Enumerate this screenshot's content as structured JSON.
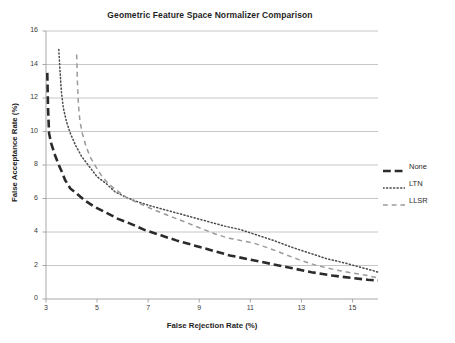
{
  "chart_data": {
    "type": "line",
    "title": "Geometric Feature Space Normalizer Comparison",
    "xlabel": "False Rejection Rate (%)",
    "ylabel": "False Acceptance Rate (%)",
    "xlim": [
      3,
      16
    ],
    "ylim": [
      0,
      16
    ],
    "xticks": [
      3,
      5,
      7,
      9,
      11,
      13,
      15
    ],
    "yticks": [
      0,
      2,
      4,
      6,
      8,
      10,
      12,
      14,
      16
    ],
    "grid": "horizontal",
    "legend_position": "right",
    "series": [
      {
        "name": "None",
        "style": "long-dash",
        "color": "#2b2b2b",
        "width": 2.6,
        "points": [
          [
            3.05,
            13.5
          ],
          [
            3.08,
            11.4
          ],
          [
            3.12,
            9.9
          ],
          [
            3.2,
            9.3
          ],
          [
            3.35,
            8.6
          ],
          [
            3.5,
            8.0
          ],
          [
            3.62,
            7.6
          ],
          [
            3.75,
            7.1
          ],
          [
            3.95,
            6.6
          ],
          [
            4.2,
            6.3
          ],
          [
            4.5,
            5.9
          ],
          [
            4.9,
            5.5
          ],
          [
            5.3,
            5.2
          ],
          [
            5.8,
            4.8
          ],
          [
            6.3,
            4.5
          ],
          [
            6.9,
            4.1
          ],
          [
            7.5,
            3.8
          ],
          [
            8.1,
            3.5
          ],
          [
            8.8,
            3.2
          ],
          [
            9.5,
            2.9
          ],
          [
            10.2,
            2.6
          ],
          [
            11.0,
            2.35
          ],
          [
            11.8,
            2.1
          ],
          [
            12.6,
            1.85
          ],
          [
            13.4,
            1.6
          ],
          [
            14.2,
            1.4
          ],
          [
            15.0,
            1.25
          ],
          [
            15.6,
            1.15
          ],
          [
            16.0,
            1.1
          ]
        ]
      },
      {
        "name": "LTN",
        "style": "dotted",
        "color": "#4a4a4a",
        "width": 1.5,
        "points": [
          [
            3.5,
            14.9
          ],
          [
            3.55,
            13.6
          ],
          [
            3.6,
            12.4
          ],
          [
            3.68,
            11.4
          ],
          [
            3.8,
            10.6
          ],
          [
            3.95,
            9.9
          ],
          [
            4.15,
            9.2
          ],
          [
            4.4,
            8.5
          ],
          [
            4.7,
            7.9
          ],
          [
            5.0,
            7.3
          ],
          [
            5.35,
            6.9
          ],
          [
            5.7,
            6.4
          ],
          [
            6.1,
            6.1
          ],
          [
            6.5,
            5.85
          ],
          [
            7.0,
            5.6
          ],
          [
            7.6,
            5.35
          ],
          [
            8.2,
            5.1
          ],
          [
            8.8,
            4.85
          ],
          [
            9.4,
            4.6
          ],
          [
            10.0,
            4.35
          ],
          [
            10.6,
            4.15
          ],
          [
            11.2,
            3.85
          ],
          [
            11.9,
            3.5
          ],
          [
            12.6,
            3.1
          ],
          [
            13.3,
            2.75
          ],
          [
            14.0,
            2.4
          ],
          [
            14.7,
            2.15
          ],
          [
            15.3,
            1.9
          ],
          [
            15.8,
            1.7
          ],
          [
            16.0,
            1.6
          ]
        ]
      },
      {
        "name": "LLSR",
        "style": "dash",
        "color": "#9a9a9a",
        "width": 1.5,
        "points": [
          [
            4.2,
            14.6
          ],
          [
            4.23,
            13.0
          ],
          [
            4.27,
            11.6
          ],
          [
            4.33,
            10.6
          ],
          [
            4.42,
            9.9
          ],
          [
            4.55,
            9.2
          ],
          [
            4.72,
            8.5
          ],
          [
            4.95,
            7.9
          ],
          [
            5.2,
            7.3
          ],
          [
            5.5,
            6.8
          ],
          [
            5.85,
            6.4
          ],
          [
            6.2,
            6.0
          ],
          [
            6.6,
            5.75
          ],
          [
            7.1,
            5.4
          ],
          [
            7.6,
            5.1
          ],
          [
            8.1,
            4.8
          ],
          [
            8.6,
            4.5
          ],
          [
            9.1,
            4.2
          ],
          [
            9.6,
            3.9
          ],
          [
            10.1,
            3.65
          ],
          [
            10.6,
            3.5
          ],
          [
            11.1,
            3.35
          ],
          [
            11.7,
            3.05
          ],
          [
            12.3,
            2.7
          ],
          [
            12.9,
            2.35
          ],
          [
            13.6,
            2.0
          ],
          [
            14.3,
            1.75
          ],
          [
            15.0,
            1.55
          ],
          [
            15.6,
            1.4
          ],
          [
            16.0,
            1.25
          ]
        ]
      }
    ]
  },
  "legend": {
    "items": [
      {
        "label": "None"
      },
      {
        "label": "LTN"
      },
      {
        "label": "LLSR"
      }
    ]
  },
  "caption": {
    "text": ""
  }
}
